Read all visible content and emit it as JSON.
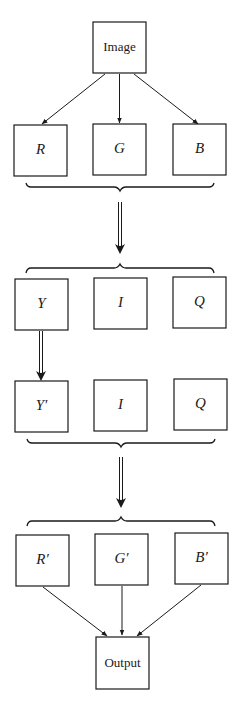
{
  "diagram": {
    "title": "",
    "type": "flowchart",
    "nodes": {
      "image": "Image",
      "r": "R",
      "g": "G",
      "b": "B",
      "y": "Y",
      "i1": "I",
      "q1": "Q",
      "y_prime": "Y′",
      "i2": "I",
      "q2": "Q",
      "r_prime": "R′",
      "g_prime": "G′",
      "b_prime": "B′",
      "output": "Output"
    },
    "edges": [
      {
        "from": "Image",
        "to": "R",
        "style": "single-arrow"
      },
      {
        "from": "Image",
        "to": "G",
        "style": "single-arrow"
      },
      {
        "from": "Image",
        "to": "B",
        "style": "single-arrow"
      },
      {
        "from": "RGB group",
        "to": "YIQ group",
        "style": "double-arrow"
      },
      {
        "from": "Y",
        "to": "Y′",
        "style": "double-arrow"
      },
      {
        "from": "Y′IQ group",
        "to": "R′G′B′ group",
        "style": "double-arrow"
      },
      {
        "from": "R′",
        "to": "Output",
        "style": "single-arrow"
      },
      {
        "from": "G′",
        "to": "Output",
        "style": "single-arrow"
      },
      {
        "from": "B′",
        "to": "Output",
        "style": "single-arrow"
      }
    ],
    "groups": [
      {
        "name": "RGB",
        "brace": "below"
      },
      {
        "name": "YIQ",
        "brace": "above"
      },
      {
        "name": "Y′IQ",
        "brace": "below"
      },
      {
        "name": "R′G′B′",
        "brace": "above"
      }
    ],
    "colors": {
      "stroke": "#1a1a1a",
      "background": "#ffffff"
    }
  }
}
